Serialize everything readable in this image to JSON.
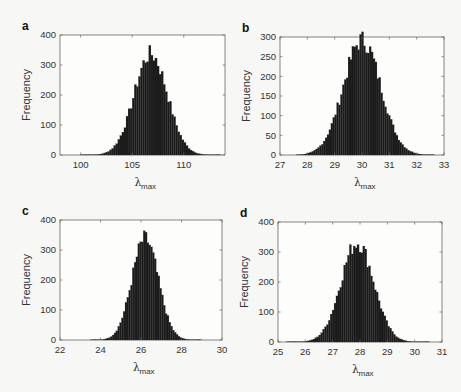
{
  "figure": {
    "background": "#f7f7f5",
    "bar_color": "#1a1a1a",
    "axis_color": "#666666"
  },
  "chart_data": [
    {
      "panel": "a",
      "type": "bar",
      "title": "",
      "xlabel": "λ_max",
      "xlabel_main": "λ",
      "xlabel_sub": "max",
      "ylabel": "Frequency",
      "xlim": [
        98,
        114
      ],
      "ylim": [
        0,
        400
      ],
      "xticks": [
        100,
        105,
        110
      ],
      "yticks": [
        0,
        100,
        200,
        300,
        400
      ],
      "grid": false,
      "box": {
        "x0": 60,
        "x1": 225,
        "y0": 35,
        "y1": 155
      },
      "mean": 106.8,
      "sd": 1.6,
      "peak": 340,
      "bins": {
        "start": 100,
        "end": 113.5,
        "width": 0.2
      }
    },
    {
      "panel": "b",
      "type": "bar",
      "title": "",
      "xlabel": "λ_max",
      "xlabel_main": "λ",
      "xlabel_sub": "max",
      "ylabel": "Frequency",
      "xlim": [
        27,
        33
      ],
      "ylim": [
        0,
        300
      ],
      "xticks": [
        27,
        28,
        29,
        30,
        31,
        32,
        33
      ],
      "yticks": [
        0,
        50,
        100,
        150,
        200,
        250,
        300
      ],
      "grid": false,
      "box": {
        "x0": 280,
        "x1": 444,
        "y0": 37,
        "y1": 155
      },
      "mean": 30.0,
      "sd": 0.68,
      "peak": 295,
      "bins": {
        "start": 27.6,
        "end": 32.6,
        "width": 0.07
      }
    },
    {
      "panel": "c",
      "type": "bar",
      "title": "",
      "xlabel": "λ_max",
      "xlabel_main": "λ",
      "xlabel_sub": "max",
      "ylabel": "Frequency",
      "xlim": [
        22,
        30
      ],
      "ylim": [
        0,
        400
      ],
      "xticks": [
        22,
        24,
        26,
        28,
        30
      ],
      "yticks": [
        0,
        100,
        200,
        300,
        400
      ],
      "grid": false,
      "box": {
        "x0": 60,
        "x1": 222,
        "y0": 220,
        "y1": 340
      },
      "mean": 26.2,
      "sd": 0.65,
      "peak": 340,
      "bins": {
        "start": 23.5,
        "end": 28.9,
        "width": 0.09
      }
    },
    {
      "panel": "d",
      "type": "bar",
      "title": "",
      "xlabel": "λ_max",
      "xlabel_main": "λ",
      "xlabel_sub": "max",
      "ylabel": "Frequency",
      "xlim": [
        25,
        31
      ],
      "ylim": [
        0,
        400
      ],
      "xticks": [
        25,
        26,
        27,
        28,
        29,
        30,
        31
      ],
      "yticks": [
        0,
        100,
        200,
        300,
        400
      ],
      "grid": false,
      "box": {
        "x0": 278,
        "x1": 442,
        "y0": 222,
        "y1": 342
      },
      "mean": 27.9,
      "sd": 0.6,
      "peak": 335,
      "bins": {
        "start": 25.3,
        "end": 30.5,
        "width": 0.07
      }
    }
  ]
}
